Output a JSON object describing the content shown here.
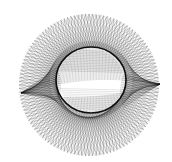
{
  "figure": {
    "description": "Abstract string-art envelope: a circular mesh of straight lines forming an outer disc with an elliptical hole and two twisted ribbon bands with cusps on the left and right",
    "background_color": "#ffffff",
    "line_color": "#000000",
    "outer": {
      "cx": 89,
      "cy": 85,
      "rx": 70,
      "ry": 71
    },
    "inner": {
      "cx": 91,
      "cy": 80,
      "rx": 35,
      "ry": 33
    },
    "families": [
      {
        "name": "twist-a",
        "count": 120,
        "phase_offset_deg": 150,
        "opacity": 0.55,
        "stroke_width": 0.35
      },
      {
        "name": "twist-b",
        "count": 120,
        "phase_offset_deg": -150,
        "opacity": 0.55,
        "stroke_width": 0.35
      },
      {
        "name": "ribbon",
        "count": 90,
        "phase_offset_deg": 180,
        "opacity": 0.45,
        "stroke_width": 0.35
      }
    ],
    "cusps": [
      {
        "name": "left-cusp",
        "x": 21,
        "y": 93
      },
      {
        "name": "right-cusp",
        "x": 160,
        "y": 84
      }
    ]
  }
}
